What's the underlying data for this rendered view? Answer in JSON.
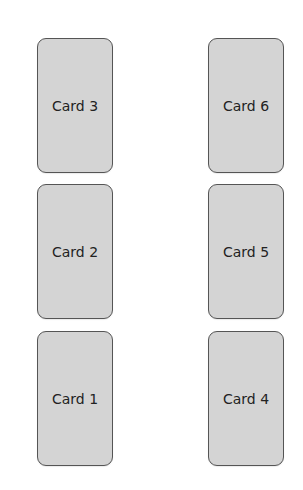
{
  "header": {
    "text": ""
  },
  "columns": [
    {
      "cards": [
        {
          "label": "Card 3"
        },
        {
          "label": "Card 2"
        },
        {
          "label": "Card 1"
        }
      ]
    },
    {
      "cards": [
        {
          "label": "Card 6"
        },
        {
          "label": "Card 5"
        },
        {
          "label": "Card 4"
        }
      ]
    }
  ],
  "colors": {
    "card_fill": "#d4d4d4",
    "card_border": "#555555",
    "background": "#ffffff"
  }
}
